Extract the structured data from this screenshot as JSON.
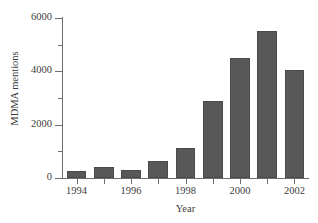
{
  "chart_data": {
    "type": "bar",
    "title": "",
    "xlabel": "Year",
    "ylabel": "MDMA mentions",
    "categories": [
      1994,
      1995,
      1996,
      1997,
      1998,
      1999,
      2000,
      2001,
      2002
    ],
    "values": [
      260,
      410,
      310,
      620,
      1130,
      2890,
      4500,
      5520,
      4050
    ],
    "xlim": [
      1993.5,
      2002.5
    ],
    "ylim": [
      0,
      6000
    ],
    "ytick_values": [
      0,
      2000,
      4000,
      6000
    ],
    "ytick_labels": [
      "0",
      "2000",
      "4000",
      "6000"
    ],
    "yminor_tick_values": [
      1000,
      3000,
      5000
    ],
    "xtick_values": [
      1994,
      1995,
      1996,
      1997,
      1998,
      1999,
      2000,
      2001,
      2002
    ],
    "xtick_labels": [
      "1994",
      "",
      "1996",
      "",
      "1998",
      "",
      "2000",
      "",
      "2002"
    ],
    "grid": false,
    "legend": false,
    "bar_color": "#585858",
    "bar_edge_color": "#4a4a4a",
    "axis_color": "#6d6d6d",
    "text_color": "#3c3c3c",
    "background_color": "#ffffff"
  }
}
